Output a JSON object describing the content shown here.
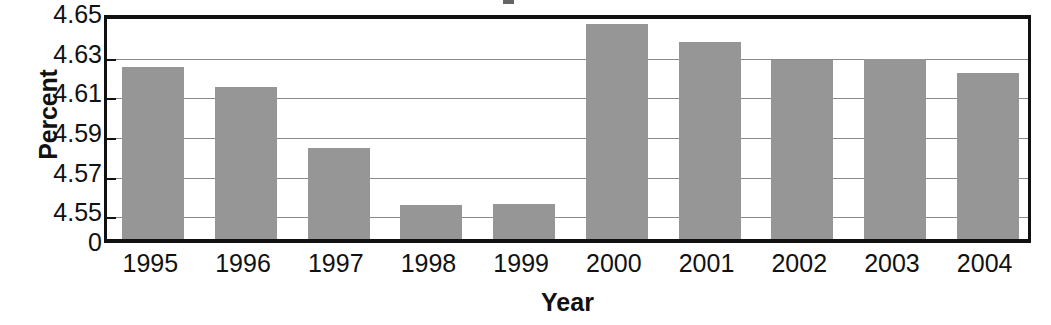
{
  "chart_data": {
    "type": "bar",
    "title": "",
    "xlabel": "Year",
    "ylabel": "Percent",
    "categories": [
      "1995",
      "1996",
      "1997",
      "1998",
      "1999",
      "2000",
      "2001",
      "2002",
      "2003",
      "2004"
    ],
    "values": [
      4.622,
      4.6115,
      4.581,
      4.5522,
      4.5527,
      4.6435,
      4.6345,
      4.6255,
      4.6258,
      4.6185
    ],
    "ylim": [
      4.54,
      4.65
    ],
    "y_tick_labels": [
      "4.65",
      "4.63",
      "4.61",
      "4.59",
      "4.57",
      "4.55",
      "0"
    ],
    "y_tick_values": [
      4.65,
      4.63,
      4.61,
      4.59,
      4.57,
      4.55,
      0
    ],
    "grid": true,
    "legend": false,
    "bar_color": "#969696",
    "axis_color": "#111111",
    "gridline_color": "#8a8a8a"
  },
  "axes": {
    "y_title": "Percent",
    "x_title": "Year"
  }
}
